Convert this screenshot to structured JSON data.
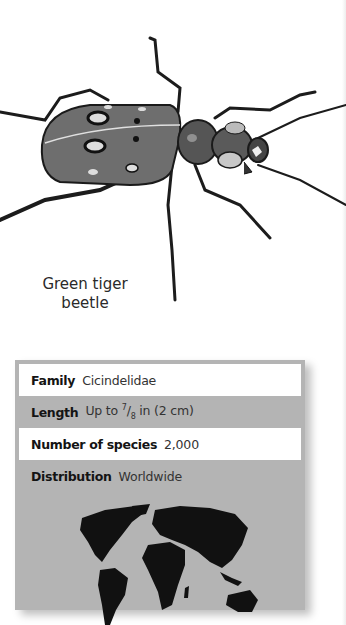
{
  "illustration": {
    "subject": "Green tiger beetle",
    "caption_line1": "Green tiger",
    "caption_line2": "beetle"
  },
  "fact_box": {
    "rows": [
      {
        "label": "Family",
        "value": "Cicindelidae",
        "style": "light"
      },
      {
        "label": "Length",
        "value": "Up to 7/8 in (2 cm)",
        "value_prefix": "Up to ",
        "frac_num": "7",
        "frac_den": "8",
        "value_suffix": " in (2 cm)",
        "style": "dark"
      },
      {
        "label": "Number of species",
        "value": "2,000",
        "style": "light"
      },
      {
        "label": "Distribution",
        "value": "Worldwide",
        "style": "dark"
      }
    ],
    "map": {
      "icon": "world-map",
      "highlight": "worldwide"
    }
  },
  "colors": {
    "box_gray": "#b4b4b4",
    "row_light": "#ffffff",
    "map_land": "#111111",
    "text": "#1a1a1a"
  }
}
